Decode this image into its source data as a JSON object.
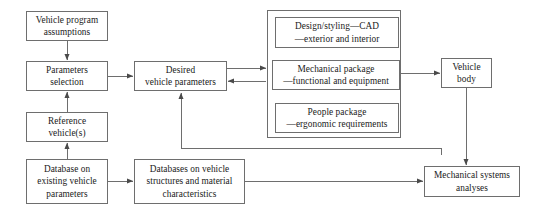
{
  "diagram": {
    "type": "flowchart",
    "stroke_color": "#6e6e6e",
    "text_color": "#1a1a1a",
    "background_color": "#ffffff"
  },
  "nodes": [
    {
      "id": "vehicle-program-assumptions",
      "label": "Vehicle program\nassumptions",
      "x": 26,
      "y": 11,
      "w": 82,
      "h": 30
    },
    {
      "id": "parameters-selection",
      "label": "Parameters\nselection",
      "x": 26,
      "y": 61,
      "w": 82,
      "h": 30
    },
    {
      "id": "reference-vehicles",
      "label": "Reference\nvehicle(s)",
      "x": 26,
      "y": 112,
      "w": 82,
      "h": 30
    },
    {
      "id": "database-existing-vehicle-parameters",
      "label": "Database on\nexisting vehicle\nparameters",
      "x": 26,
      "y": 159,
      "w": 82,
      "h": 45
    },
    {
      "id": "desired-vehicle-parameters",
      "label": "Desired\nvehicle parameters",
      "x": 134,
      "y": 61,
      "w": 93,
      "h": 30
    },
    {
      "id": "databases-vehicle-structures-materials",
      "label": "Databases on vehicle\nstructures and material\ncharacteristics",
      "x": 134,
      "y": 159,
      "w": 111,
      "h": 45
    },
    {
      "id": "design-styling-cad",
      "label": "Design/styling—CAD\n—exterior and interior",
      "x": 275,
      "y": 17,
      "w": 124,
      "h": 31
    },
    {
      "id": "mechanical-package",
      "label": "Mechanical package\n—functional and equipment",
      "x": 272,
      "y": 60,
      "w": 128,
      "h": 30
    },
    {
      "id": "people-package",
      "label": "People package\n—ergonomic requirements",
      "x": 275,
      "y": 103,
      "w": 124,
      "h": 30
    },
    {
      "id": "vehicle-body",
      "label": "Vehicle\nbody",
      "x": 441,
      "y": 58,
      "w": 51,
      "h": 30
    },
    {
      "id": "mechanical-systems-analyses",
      "label": "Mechanical systems\nanalyses",
      "x": 424,
      "y": 166,
      "w": 96,
      "h": 31
    }
  ],
  "group_box": {
    "id": "vehicle-packaging-group",
    "x": 267,
    "y": 10,
    "w": 134,
    "h": 128
  },
  "connectors": [
    {
      "id": "assumptions-to-parameters",
      "from": "vehicle-program-assumptions",
      "to": "parameters-selection"
    },
    {
      "id": "reference-to-parameters",
      "from": "reference-vehicles",
      "to": "parameters-selection"
    },
    {
      "id": "database-to-reference",
      "from": "database-existing-vehicle-parameters",
      "to": "reference-vehicles"
    },
    {
      "id": "parameters-to-desired",
      "from": "parameters-selection",
      "to": "desired-vehicle-parameters"
    },
    {
      "id": "desired-to-package-group",
      "from": "desired-vehicle-parameters",
      "to": "mechanical-package"
    },
    {
      "id": "package-group-to-desired",
      "from": "mechanical-package",
      "to": "desired-vehicle-parameters"
    },
    {
      "id": "design-to-mechanical",
      "from": "design-styling-cad",
      "to": "mechanical-package"
    },
    {
      "id": "mechanical-to-design",
      "from": "mechanical-package",
      "to": "design-styling-cad"
    },
    {
      "id": "mechanical-to-people",
      "from": "mechanical-package",
      "to": "people-package"
    },
    {
      "id": "people-to-mechanical",
      "from": "people-package",
      "to": "mechanical-package"
    },
    {
      "id": "mechanical-to-vehicle-body",
      "from": "mechanical-package",
      "to": "vehicle-body"
    },
    {
      "id": "vehicle-body-to-analyses",
      "from": "vehicle-body",
      "to": "mechanical-systems-analyses"
    },
    {
      "id": "databases-to-analyses",
      "from": "databases-vehicle-structures-materials",
      "to": "mechanical-systems-analyses"
    },
    {
      "id": "database-to-databases",
      "from": "database-existing-vehicle-parameters",
      "to": "databases-vehicle-structures-materials"
    },
    {
      "id": "analyses-feedback-to-desired",
      "from": "mechanical-systems-analyses",
      "to": "desired-vehicle-parameters"
    }
  ]
}
